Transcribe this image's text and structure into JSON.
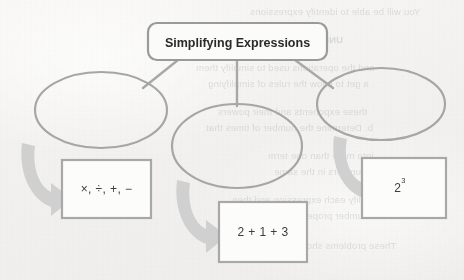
{
  "page": {
    "background_color": "#f2f1ef",
    "kind": "scanned-textbook-page"
  },
  "diagram": {
    "type": "concept-map",
    "title_box": {
      "label": "Simplifying Expressions",
      "shape": "rounded-rectangle",
      "border_color": "#9a9a9a",
      "fill_color": "#fbfbfa"
    },
    "connectors": [
      {
        "name": "connector-left",
        "from": "title-box",
        "to": "ellipse-left"
      },
      {
        "name": "connector-center",
        "from": "title-box",
        "to": "ellipse-center"
      },
      {
        "name": "connector-right",
        "from": "title-box",
        "to": "ellipse-right"
      }
    ],
    "ellipses": [
      {
        "name": "ellipse-left",
        "label": "",
        "border_color": "#a6a6a6"
      },
      {
        "name": "ellipse-center",
        "label": "",
        "border_color": "#a6a6a6"
      },
      {
        "name": "ellipse-right",
        "label": "",
        "border_color": "#a6a6a6"
      }
    ],
    "arrows": [
      {
        "name": "arrow-left",
        "from": "ellipse-left",
        "to": "example-box-left",
        "color": "#cfcfcf"
      },
      {
        "name": "arrow-center",
        "from": "ellipse-center",
        "to": "example-box-center",
        "color": "#cfcfcf"
      },
      {
        "name": "arrow-right",
        "from": "ellipse-right",
        "to": "example-box-right",
        "color": "#cfcfcf"
      }
    ],
    "example_boxes": [
      {
        "name": "example-box-left",
        "text": "×, ÷, +, −",
        "base": "",
        "exponent": "",
        "border_color": "#a8a8a8",
        "fill_color": "#fcfcfb"
      },
      {
        "name": "example-box-center",
        "text": "2 + 1 + 3",
        "base": "",
        "exponent": "",
        "border_color": "#a8a8a8",
        "fill_color": "#fcfcfb"
      },
      {
        "name": "example-box-right",
        "text": "",
        "base": "2",
        "exponent": "3",
        "border_color": "#a8a8a8",
        "fill_color": "#fcfcfb"
      }
    ]
  },
  "bleed_through": {
    "description": "faint mirrored text showing through from the reverse side of the page",
    "lines": [
      {
        "text": "You will be able to identify expressions",
        "x": 250,
        "y": 6,
        "bold": false
      },
      {
        "text": "UNPACKING THE",
        "x": 262,
        "y": 34,
        "bold": true
      },
      {
        "text": "and the operations used to simplify them",
        "x": 196,
        "y": 62,
        "bold": false
      },
      {
        "text": "a get to know the rules of simplifying",
        "x": 208,
        "y": 78,
        "bold": false
      },
      {
        "text": "these exponents and their powers",
        "x": 218,
        "y": 106,
        "bold": false
      },
      {
        "text": "b. Determine the number of times that",
        "x": 206,
        "y": 122,
        "bold": false
      },
      {
        "text": "into more than one term",
        "x": 268,
        "y": 150,
        "bold": false
      },
      {
        "text": "c. Numbers in the same",
        "x": 274,
        "y": 166,
        "bold": false
      },
      {
        "text": "Simplify each expression and then",
        "x": 232,
        "y": 194,
        "bold": false
      },
      {
        "text": "number properties",
        "x": 288,
        "y": 210,
        "bold": false
      },
      {
        "text": "These problems show you as simple",
        "x": 236,
        "y": 240,
        "bold": false
      }
    ]
  }
}
